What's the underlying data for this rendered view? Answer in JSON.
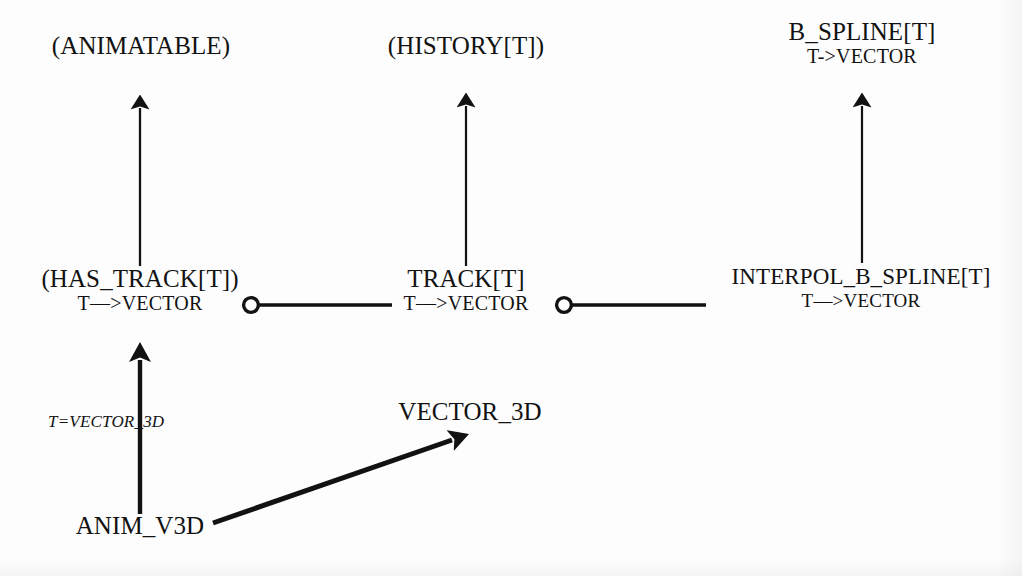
{
  "diagram": {
    "background_color": "#fdfdfd",
    "ink_color": "#121212",
    "nodes": {
      "animatable": {
        "name": "(ANIMATABLE)",
        "signature": ""
      },
      "history": {
        "name": "(HISTORY[T])",
        "signature": ""
      },
      "b_spline": {
        "name": "B_SPLINE[T]",
        "signature": "T->VECTOR"
      },
      "has_track": {
        "name": "(HAS_TRACK[T])",
        "signature": "T—>VECTOR"
      },
      "track": {
        "name": "TRACK[T]",
        "signature": "T—>VECTOR"
      },
      "interpol_b_spline": {
        "name": "INTERPOL_B_SPLINE[T]",
        "signature": "T—>VECTOR"
      },
      "anim_v3d": {
        "name": "ANIM_V3D",
        "signature": ""
      },
      "vector_3d": {
        "name": "VECTOR_3D",
        "signature": ""
      }
    },
    "edge_labels": {
      "anim_v3d_generic": "T=VECTOR_3D"
    },
    "relations": [
      {
        "kind": "inheritance",
        "from": "has_track",
        "to": "animatable"
      },
      {
        "kind": "inheritance",
        "from": "track",
        "to": "history"
      },
      {
        "kind": "inheritance",
        "from": "interpol_b_spline",
        "to": "b_spline"
      },
      {
        "kind": "inheritance",
        "from": "anim_v3d",
        "to": "has_track",
        "label": "T=VECTOR_3D"
      },
      {
        "kind": "client",
        "from": "has_track",
        "to": "track"
      },
      {
        "kind": "client",
        "from": "track",
        "to": "interpol_b_spline"
      },
      {
        "kind": "client-arrow",
        "from": "anim_v3d",
        "to": "vector_3d"
      }
    ]
  }
}
